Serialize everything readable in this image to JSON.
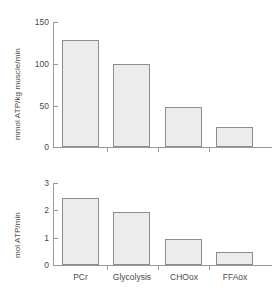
{
  "chart_data": [
    {
      "type": "bar",
      "panel": "top",
      "title": "",
      "xlabel": "",
      "ylabel": "mmol ATP/kg muscle/min",
      "categories": [
        "PCr",
        "Glycolysis",
        "CHOox",
        "FFAox"
      ],
      "values": [
        128,
        100,
        48,
        24
      ],
      "ylim": [
        0,
        150
      ],
      "yticks": [
        0,
        50,
        100,
        150
      ],
      "ytick_labels": [
        "0",
        "50",
        "100",
        "150"
      ],
      "grid": false,
      "legend": "none"
    },
    {
      "type": "bar",
      "panel": "bottom",
      "title": "",
      "xlabel": "",
      "ylabel": "mol ATP/min",
      "categories": [
        "PCr",
        "Glycolysis",
        "CHOox",
        "FFAox"
      ],
      "values": [
        2.45,
        1.95,
        0.95,
        0.48
      ],
      "ylim": [
        0,
        3
      ],
      "yticks": [
        0,
        1,
        2,
        3
      ],
      "ytick_labels": [
        "0",
        "1",
        "2",
        "3"
      ],
      "grid": false,
      "legend": "none"
    }
  ],
  "style": {
    "bar_fill": "#ececec",
    "bar_stroke": "#8d8d8d",
    "axis_color": "#9a9a9a",
    "text_color": "#4a4a4a",
    "background": "#ffffff"
  }
}
